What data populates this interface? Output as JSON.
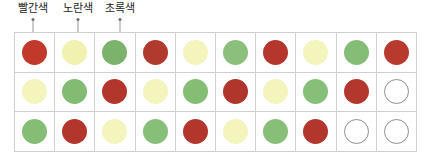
{
  "legend": {
    "items": [
      {
        "label": "빨간색",
        "x": 33,
        "color": "#d94a43"
      },
      {
        "label": "노란색",
        "x": 78,
        "color": "#ecec9a"
      },
      {
        "label": "초록색",
        "x": 120,
        "color": "#7fbf72"
      }
    ]
  },
  "grid": {
    "columns": 10,
    "rows": 3,
    "border_color": "#d0d0d0",
    "empty_color": "#ffffff",
    "empty_border_color": "#8d8d8d",
    "cells": [
      [
        {
          "color": "#c0392b",
          "name": "red"
        },
        {
          "color": "#f2f2b0",
          "name": "yellow"
        },
        {
          "color": "#7cb36c",
          "name": "green"
        },
        {
          "color": "#b03a2e",
          "name": "red"
        },
        {
          "color": "#f4f4bc",
          "name": "yellow"
        },
        {
          "color": "#8cbf7c",
          "name": "green"
        },
        {
          "color": "#b5362c",
          "name": "red"
        },
        {
          "color": "#f4f4bd",
          "name": "yellow"
        },
        {
          "color": "#86bd76",
          "name": "green"
        },
        {
          "color": "#b83a2f",
          "name": "red"
        }
      ],
      [
        {
          "color": "#f4f4bd",
          "name": "yellow"
        },
        {
          "color": "#82bb72",
          "name": "green"
        },
        {
          "color": "#b2362c",
          "name": "red"
        },
        {
          "color": "#f4f4bd",
          "name": "yellow"
        },
        {
          "color": "#84bd74",
          "name": "green"
        },
        {
          "color": "#b0352b",
          "name": "red"
        },
        {
          "color": "#f4f4bd",
          "name": "yellow"
        },
        {
          "color": "#86bf78",
          "name": "green"
        },
        {
          "color": "#b4372d",
          "name": "red"
        },
        {
          "color": "#ffffff",
          "name": "empty"
        }
      ],
      [
        {
          "color": "#84bd74",
          "name": "green"
        },
        {
          "color": "#b2362c",
          "name": "red"
        },
        {
          "color": "#f4f4bd",
          "name": "yellow"
        },
        {
          "color": "#88bf78",
          "name": "green"
        },
        {
          "color": "#b2362c",
          "name": "red"
        },
        {
          "color": "#f4f4bd",
          "name": "yellow"
        },
        {
          "color": "#88bf78",
          "name": "green"
        },
        {
          "color": "#b2362c",
          "name": "red"
        },
        {
          "color": "#ffffff",
          "name": "empty"
        },
        {
          "color": "#ffffff",
          "name": "empty"
        }
      ]
    ]
  }
}
